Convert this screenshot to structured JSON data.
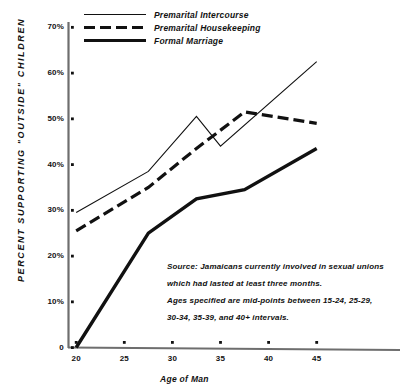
{
  "chart_data": {
    "type": "line",
    "title": "",
    "xlabel": "Age of Man",
    "ylabel": "PERCENT SUPPORTING \"OUTSIDE\" CHILDREN",
    "x_ticks": [
      20,
      25,
      30,
      35,
      40,
      45
    ],
    "x_tick_labels": [
      "20",
      "25",
      "30",
      "35",
      "40",
      "45"
    ],
    "y_ticks": [
      0,
      10,
      20,
      30,
      40,
      50,
      60,
      70
    ],
    "y_tick_labels": [
      "0",
      "10%",
      "20%",
      "30%",
      "40%",
      "50%",
      "60%",
      "70%"
    ],
    "xlim": [
      19,
      49
    ],
    "ylim": [
      0,
      72
    ],
    "grid": false,
    "legend_position": "top-left",
    "series": [
      {
        "name": "Premarital Intercourse",
        "style": "thin-solid",
        "x": [
          20,
          27.5,
          32.5,
          35,
          45
        ],
        "values": [
          29.5,
          38.5,
          50.5,
          44,
          62.5
        ]
      },
      {
        "name": "Premarital Housekeeping",
        "style": "dashed",
        "x": [
          20,
          27.5,
          32.5,
          37.5,
          45
        ],
        "values": [
          25.5,
          35,
          43.5,
          51.5,
          49
        ]
      },
      {
        "name": "Formal Marriage",
        "style": "thick-solid",
        "x": [
          20,
          27.5,
          32.5,
          37.5,
          45
        ],
        "values": [
          0,
          25,
          32.5,
          34.5,
          43.5
        ]
      }
    ],
    "annotations": [
      "Source: Jamaicans currently involved in sexual unions",
      "which  had lasted at least three months.",
      "Ages specified are mid-points between 15-24, 25-29,",
      "30-34, 35-39, and 40+  intervals."
    ]
  },
  "colors": {
    "ink": "#111111",
    "axis": "#6e6e6e",
    "background": "#ffffff"
  }
}
